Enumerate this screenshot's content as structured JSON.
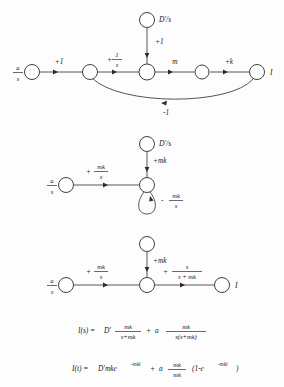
{
  "figure": {
    "background_color": "#fdfdfd",
    "ink_color": "#2b2b2b"
  },
  "diagram1": {
    "name": "original-signal-flow-graph",
    "input_label_num": "a",
    "input_label_den": "s",
    "source_label": "D'/s",
    "output_label": "I",
    "edges": [
      {
        "id": "e1",
        "label": "+1"
      },
      {
        "id": "e2",
        "label_sign": "+",
        "label_num": "1",
        "label_den": "s"
      },
      {
        "id": "e3",
        "label": "+1"
      },
      {
        "id": "e4",
        "label": "m"
      },
      {
        "id": "e5",
        "label": "+k"
      },
      {
        "id": "e6",
        "label": "-1"
      }
    ]
  },
  "diagram2": {
    "name": "partially-reduced-graph",
    "input_label_num": "a",
    "input_label_den": "s",
    "source_label": "D'/s",
    "edges": [
      {
        "id": "e1",
        "label_sign": "+",
        "label_num": "mk",
        "label_den": "s"
      },
      {
        "id": "e2",
        "label": "+mk"
      },
      {
        "id": "e3",
        "label_sign": "-",
        "label_num": "mk",
        "label_den": "s"
      }
    ]
  },
  "diagram3": {
    "name": "fully-reduced-graph",
    "input_label_num": "a",
    "input_label_den": "s",
    "output_label": "I",
    "edges": [
      {
        "id": "e1",
        "label_sign": "+",
        "label_num": "mk",
        "label_den": "s"
      },
      {
        "id": "e2",
        "label": "+mk"
      },
      {
        "id": "e3",
        "label_sign": "+",
        "label_num": "s",
        "label_den": "s + mk"
      }
    ]
  },
  "equations": {
    "laplace": {
      "lhs": "I(s) =",
      "term1_coef": "D'",
      "term1_num": "mk",
      "term1_den": "s+mk",
      "plus": "+",
      "term2_coef": "a",
      "term2_num": "mk",
      "term2_den": "s(s+mk)"
    },
    "time": {
      "lhs": "I(t) =",
      "term1_coef": "D'mke",
      "term1_exp": "-mkt",
      "plus": "+",
      "term2_coef": "a",
      "term2_num": "mk",
      "term2_den": "mk",
      "term2_open": "(1-e",
      "term2_exp": "-mkt",
      "term2_close": ")"
    }
  }
}
